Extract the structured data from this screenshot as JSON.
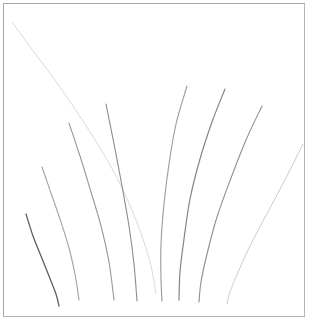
{
  "figure": {
    "title": "",
    "background_color": "#ffffff",
    "frame_color": "#a8a8a8",
    "frame": {
      "x": 3,
      "y": 3,
      "width": 302,
      "height": 314
    },
    "canvas_size": {
      "width": 312,
      "height": 329
    }
  },
  "chart_data": {
    "type": "line",
    "title": "",
    "subtitle": "",
    "xlabel": "",
    "ylabel": "",
    "xlim": [
      0,
      302
    ],
    "ylim": [
      0,
      314
    ],
    "grid": false,
    "legend": false,
    "legend_position": "none",
    "stroke_color": "#555555",
    "curve_count": 9,
    "series": [
      {
        "name": "curve-1",
        "label": "leftmost-faint-long",
        "opacity": 0.22,
        "stroke_width": 1.0,
        "points": [
          [
            8,
            18
          ],
          [
            30,
            48
          ],
          [
            58,
            86
          ],
          [
            86,
            128
          ],
          [
            112,
            172
          ],
          [
            132,
            216
          ],
          [
            146,
            258
          ],
          [
            152,
            290
          ]
        ]
      },
      {
        "name": "curve-2",
        "label": "left-darkest-short",
        "opacity": 0.95,
        "stroke_width": 1.3,
        "points": [
          [
            22,
            210
          ],
          [
            29,
            232
          ],
          [
            37,
            252
          ],
          [
            45,
            272
          ],
          [
            52,
            290
          ],
          [
            55,
            302
          ]
        ]
      },
      {
        "name": "curve-3",
        "label": "left-medium",
        "opacity": 0.55,
        "stroke_width": 1.1,
        "points": [
          [
            38,
            163
          ],
          [
            48,
            192
          ],
          [
            57,
            218
          ],
          [
            65,
            244
          ],
          [
            71,
            270
          ],
          [
            75,
            296
          ]
        ]
      },
      {
        "name": "curve-4",
        "label": "left-inner",
        "opacity": 0.62,
        "stroke_width": 1.1,
        "points": [
          [
            65,
            119
          ],
          [
            76,
            152
          ],
          [
            87,
            188
          ],
          [
            97,
            222
          ],
          [
            105,
            258
          ],
          [
            110,
            296
          ]
        ]
      },
      {
        "name": "curve-5",
        "label": "center-left-tall",
        "opacity": 0.68,
        "stroke_width": 1.1,
        "points": [
          [
            102,
            100
          ],
          [
            110,
            140
          ],
          [
            118,
            182
          ],
          [
            125,
            222
          ],
          [
            130,
            260
          ],
          [
            133,
            297
          ]
        ]
      },
      {
        "name": "curve-6",
        "label": "center-right-vertical",
        "opacity": 0.6,
        "stroke_width": 1.1,
        "points": [
          [
            183,
            82
          ],
          [
            172,
            120
          ],
          [
            165,
            160
          ],
          [
            160,
            200
          ],
          [
            157,
            240
          ],
          [
            157,
            275
          ],
          [
            158,
            297
          ]
        ]
      },
      {
        "name": "curve-7",
        "label": "right-inner-bowed",
        "opacity": 0.72,
        "stroke_width": 1.2,
        "points": [
          [
            221,
            85
          ],
          [
            208,
            118
          ],
          [
            196,
            155
          ],
          [
            186,
            195
          ],
          [
            180,
            235
          ],
          [
            176,
            268
          ],
          [
            175,
            296
          ]
        ]
      },
      {
        "name": "curve-8",
        "label": "right-outer-bowed",
        "opacity": 0.66,
        "stroke_width": 1.1,
        "points": [
          [
            258,
            102
          ],
          [
            242,
            136
          ],
          [
            227,
            174
          ],
          [
            213,
            213
          ],
          [
            203,
            250
          ],
          [
            197,
            278
          ],
          [
            195,
            298
          ]
        ]
      },
      {
        "name": "curve-9",
        "label": "rightmost-faint",
        "opacity": 0.3,
        "stroke_width": 1.0,
        "points": [
          [
            299,
            140
          ],
          [
            283,
            172
          ],
          [
            266,
            204
          ],
          [
            249,
            236
          ],
          [
            235,
            266
          ],
          [
            226,
            288
          ],
          [
            223,
            300
          ]
        ]
      }
    ]
  }
}
